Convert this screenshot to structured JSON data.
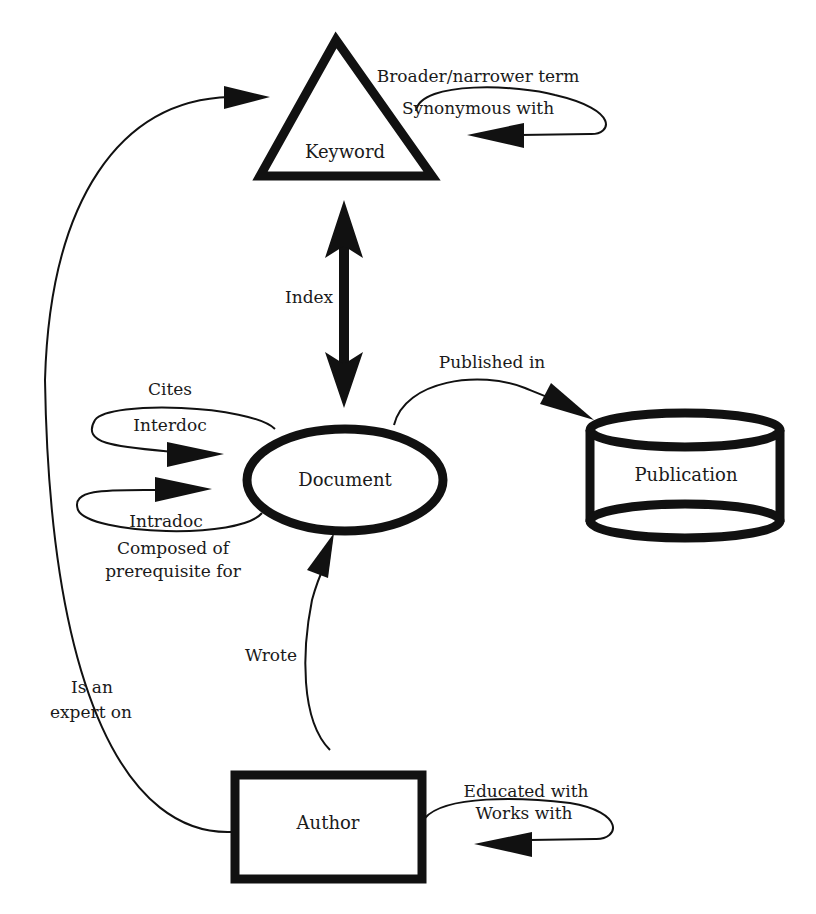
{
  "diagram": {
    "nodes": {
      "keyword": {
        "label": "Keyword",
        "shape": "triangle"
      },
      "document": {
        "label": "Document",
        "shape": "ellipse"
      },
      "publication": {
        "label": "Publication",
        "shape": "cylinder"
      },
      "author": {
        "label": "Author",
        "shape": "rectangle"
      }
    },
    "edges": {
      "keyword_self": {
        "label_1": "Broader/narrower term",
        "label_2": "Synonymous with"
      },
      "index": {
        "label": "Index"
      },
      "published_in": {
        "label": "Published in"
      },
      "document_interdoc": {
        "label_top": "Cites",
        "label_inner": "Interdoc"
      },
      "document_intradoc": {
        "label_inner": "Intradoc",
        "label_1": "Composed of",
        "label_2": "prerequisite for"
      },
      "wrote": {
        "label": "Wrote"
      },
      "expert_on": {
        "label_1": "Is an",
        "label_2": "expert on"
      },
      "author_self": {
        "label_1": "Educated with",
        "label_2": "Works with"
      }
    },
    "colors": {
      "stroke": "#111111",
      "background": "#ffffff"
    }
  }
}
